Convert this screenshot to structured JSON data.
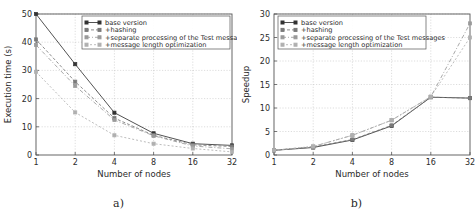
{
  "figure": {
    "panel_a_caption": "a)",
    "panel_b_caption": "b)"
  },
  "chart_data": [
    {
      "id": "panel-a",
      "type": "line",
      "title": "",
      "xlabel": "Number of nodes",
      "ylabel": "Execution time (s)",
      "x": [
        1,
        2,
        4,
        8,
        16,
        32
      ],
      "xtick_labels": [
        "1",
        "2",
        "4",
        "8",
        "16",
        "32"
      ],
      "ytick_labels": [
        "0",
        "10",
        "20",
        "30",
        "40",
        "50"
      ],
      "yticks": [
        0,
        10,
        20,
        30,
        40,
        50
      ],
      "ylim": [
        0,
        50
      ],
      "grid": true,
      "legend_position": "upper right",
      "series": [
        {
          "name": "base version",
          "values": [
            50.0,
            32.2,
            15.0,
            7.7,
            4.0,
            3.4
          ],
          "color": "#333333",
          "dash": "none",
          "marker": "square"
        },
        {
          "name": "+hashing",
          "values": [
            41.0,
            26.0,
            13.1,
            7.0,
            3.6,
            3.0
          ],
          "color": "#7a7a7a",
          "dash": "3 2",
          "marker": "square"
        },
        {
          "name": "+separate processing of the Test messages",
          "values": [
            39.0,
            24.5,
            12.4,
            6.8,
            3.2,
            2.2
          ],
          "color": "#9a9a9a",
          "dash": "4 2 1 2",
          "marker": "square"
        },
        {
          "name": "+message length optimization",
          "values": [
            29.5,
            15.1,
            7.0,
            4.0,
            2.3,
            1.1
          ],
          "color": "#b0b0b0",
          "dash": "2 2",
          "marker": "square"
        }
      ]
    },
    {
      "id": "panel-b",
      "type": "line",
      "title": "",
      "xlabel": "Number of nodes",
      "ylabel": "Speedup",
      "x": [
        1,
        2,
        4,
        8,
        16,
        32
      ],
      "xtick_labels": [
        "1",
        "2",
        "4",
        "8",
        "16",
        "32"
      ],
      "ytick_labels": [
        "0",
        "5",
        "10",
        "15",
        "20",
        "25",
        "30"
      ],
      "yticks": [
        0,
        5,
        10,
        15,
        20,
        25,
        30
      ],
      "ylim": [
        0,
        30
      ],
      "grid": true,
      "legend_position": "upper left",
      "series": [
        {
          "name": "base version",
          "values": [
            1.0,
            1.6,
            3.2,
            6.2,
            12.3,
            12.1
          ],
          "color": "#333333",
          "dash": "none",
          "marker": "square"
        },
        {
          "name": "+hashing",
          "values": [
            1.0,
            1.7,
            3.3,
            6.3,
            12.3,
            12.1
          ],
          "color": "#7a7a7a",
          "dash": "3 2",
          "marker": "square"
        },
        {
          "name": "+separate processing of the Test messages",
          "values": [
            1.0,
            1.8,
            4.2,
            7.4,
            12.4,
            28.0
          ],
          "color": "#9a9a9a",
          "dash": "4 2 1 2",
          "marker": "square"
        },
        {
          "name": "+message length optimization",
          "values": [
            1.0,
            1.8,
            4.2,
            7.4,
            12.4,
            25.0
          ],
          "color": "#b0b0b0",
          "dash": "2 2",
          "marker": "square"
        }
      ]
    }
  ]
}
